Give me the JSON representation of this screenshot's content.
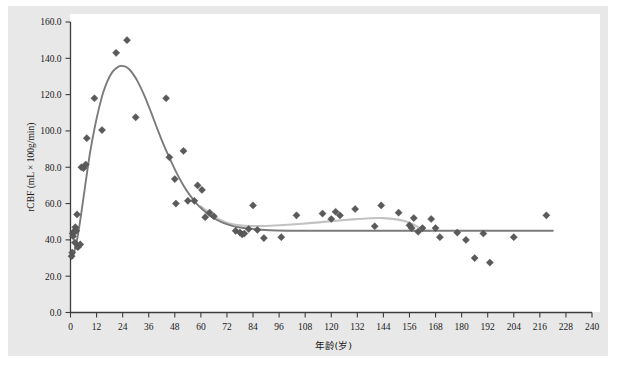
{
  "chart_data": {
    "type": "scatter",
    "title": "",
    "xlabel": "年龄(岁)",
    "ylabel": "rCBF (mL × 100g/min)",
    "xlim": [
      0,
      240
    ],
    "ylim": [
      0,
      160
    ],
    "xticks": [
      0,
      12,
      24,
      36,
      48,
      60,
      72,
      84,
      96,
      108,
      120,
      132,
      144,
      156,
      168,
      180,
      192,
      204,
      216,
      228,
      240
    ],
    "yticks": [
      "0.0",
      "20.0",
      "40.0",
      "60.0",
      "80.0",
      "100.0",
      "120.0",
      "140.0",
      "160.0"
    ],
    "grid": false,
    "legend": "none",
    "colors": {
      "marker": "#5a5a5a",
      "fit_main": "#7b7b7b",
      "fit_secondary": "#c2c2c2",
      "axis": "#3c3c3c",
      "panel_background": "#e8e8e8",
      "plot_background": "#ffffff"
    },
    "series": [
      {
        "name": "rCBF observations",
        "marker": "diamond",
        "points": [
          [
            0.5,
            31.0
          ],
          [
            0.8,
            33.0
          ],
          [
            1.0,
            43.5
          ],
          [
            1.2,
            42.0
          ],
          [
            1.5,
            44.5
          ],
          [
            2.0,
            38.5
          ],
          [
            2.2,
            47.0
          ],
          [
            2.6,
            45.0
          ],
          [
            3.0,
            54.0
          ],
          [
            3.4,
            36.0
          ],
          [
            4.5,
            37.5
          ],
          [
            5.0,
            80.0
          ],
          [
            6.0,
            79.5
          ],
          [
            7.0,
            81.5
          ],
          [
            7.5,
            96.0
          ],
          [
            11.0,
            118.0
          ],
          [
            14.5,
            100.5
          ],
          [
            21.0,
            143.0
          ],
          [
            26.0,
            150.0
          ],
          [
            30.0,
            107.5
          ],
          [
            44.0,
            118.0
          ],
          [
            45.5,
            85.5
          ],
          [
            48.0,
            73.5
          ],
          [
            48.5,
            60.0
          ],
          [
            52.0,
            89.0
          ],
          [
            54.0,
            61.5
          ],
          [
            57.0,
            61.5
          ],
          [
            58.5,
            70.0
          ],
          [
            60.5,
            67.5
          ],
          [
            62.0,
            52.5
          ],
          [
            64.0,
            55.0
          ],
          [
            66.0,
            53.0
          ],
          [
            76.0,
            45.0
          ],
          [
            78.0,
            44.0
          ],
          [
            79.0,
            43.0
          ],
          [
            80.0,
            43.5
          ],
          [
            82.0,
            46.0
          ],
          [
            84.0,
            59.0
          ],
          [
            86.0,
            45.5
          ],
          [
            89.0,
            41.0
          ],
          [
            97.0,
            41.5
          ],
          [
            104.0,
            53.5
          ],
          [
            116.0,
            54.5
          ],
          [
            120.0,
            51.5
          ],
          [
            122.0,
            55.5
          ],
          [
            124.0,
            53.5
          ],
          [
            131.0,
            57.0
          ],
          [
            140.0,
            47.5
          ],
          [
            143.0,
            59.0
          ],
          [
            151.0,
            55.0
          ],
          [
            156.0,
            48.0
          ],
          [
            157.0,
            46.5
          ],
          [
            158.0,
            52.0
          ],
          [
            160.0,
            44.5
          ],
          [
            162.0,
            46.5
          ],
          [
            166.0,
            51.5
          ],
          [
            168.0,
            46.5
          ],
          [
            170.0,
            41.5
          ],
          [
            178.0,
            44.0
          ],
          [
            182.0,
            40.0
          ],
          [
            186.0,
            30.0
          ],
          [
            190.0,
            43.5
          ],
          [
            193.0,
            27.5
          ],
          [
            204.0,
            41.5
          ],
          [
            219.0,
            53.5
          ]
        ]
      }
    ],
    "fits": [
      {
        "name": "primary fitted curve",
        "color": "#7b7b7b",
        "points": [
          [
            1.0,
            30.0
          ],
          [
            3.0,
            40.0
          ],
          [
            5.0,
            55.0
          ],
          [
            7.0,
            72.0
          ],
          [
            9.0,
            88.0
          ],
          [
            11.0,
            101.0
          ],
          [
            13.0,
            112.0
          ],
          [
            15.0,
            121.0
          ],
          [
            17.0,
            127.5
          ],
          [
            19.0,
            132.0
          ],
          [
            21.0,
            134.5
          ],
          [
            23.0,
            135.8
          ],
          [
            25.0,
            135.5
          ],
          [
            27.0,
            134.0
          ],
          [
            29.0,
            131.0
          ],
          [
            31.0,
            127.0
          ],
          [
            34.0,
            119.5
          ],
          [
            37.0,
            110.5
          ],
          [
            40.0,
            101.0
          ],
          [
            43.0,
            92.0
          ],
          [
            46.0,
            84.0
          ],
          [
            49.0,
            76.5
          ],
          [
            52.0,
            70.0
          ],
          [
            55.0,
            64.5
          ],
          [
            58.0,
            60.0
          ],
          [
            61.0,
            56.5
          ],
          [
            64.0,
            53.5
          ],
          [
            67.0,
            51.2
          ],
          [
            70.0,
            49.5
          ],
          [
            74.0,
            47.8
          ],
          [
            78.0,
            46.8
          ],
          [
            82.0,
            46.2
          ],
          [
            88.0,
            45.6
          ],
          [
            95.0,
            45.2
          ],
          [
            105.0,
            45.0
          ],
          [
            120.0,
            45.0
          ],
          [
            140.0,
            45.0
          ],
          [
            160.0,
            45.0
          ],
          [
            180.0,
            45.0
          ],
          [
            200.0,
            45.0
          ],
          [
            215.0,
            45.0
          ],
          [
            222.0,
            45.0
          ]
        ]
      },
      {
        "name": "secondary fitted curve",
        "color": "#c2c2c2",
        "points": [
          [
            60.0,
            58.5
          ],
          [
            64.0,
            54.5
          ],
          [
            68.0,
            51.5
          ],
          [
            72.0,
            49.5
          ],
          [
            76.0,
            48.3
          ],
          [
            80.0,
            47.8
          ],
          [
            86.0,
            47.6
          ],
          [
            92.0,
            47.8
          ],
          [
            100.0,
            48.3
          ],
          [
            110.0,
            49.2
          ],
          [
            120.0,
            50.3
          ],
          [
            130.0,
            51.3
          ],
          [
            138.0,
            51.9
          ],
          [
            144.0,
            52.0
          ],
          [
            150.0,
            51.3
          ],
          [
            154.0,
            50.2
          ],
          [
            158.0,
            48.3
          ],
          [
            161.0,
            46.3
          ],
          [
            163.0,
            45.2
          ],
          [
            165.0,
            44.8
          ]
        ]
      }
    ]
  }
}
